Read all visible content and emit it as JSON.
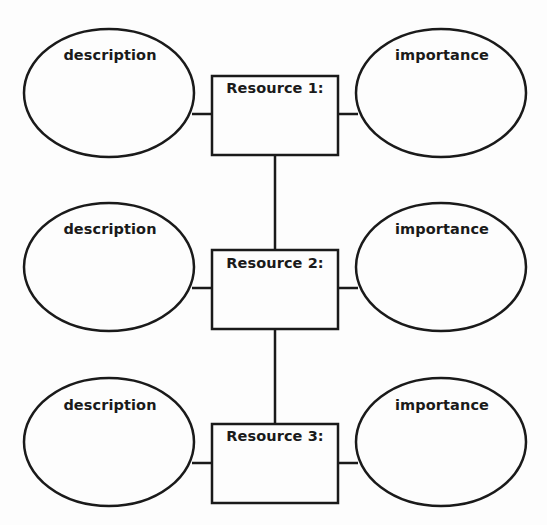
{
  "diagram": {
    "rows": [
      {
        "resource_label": "Resource 1:",
        "left_label": "description",
        "right_label": "importance"
      },
      {
        "resource_label": "Resource 2:",
        "left_label": "description",
        "right_label": "importance"
      },
      {
        "resource_label": "Resource 3:",
        "left_label": "description",
        "right_label": "importance"
      }
    ],
    "colors": {
      "stroke": "#1a1a1a",
      "background": "#fdfdfd"
    }
  }
}
